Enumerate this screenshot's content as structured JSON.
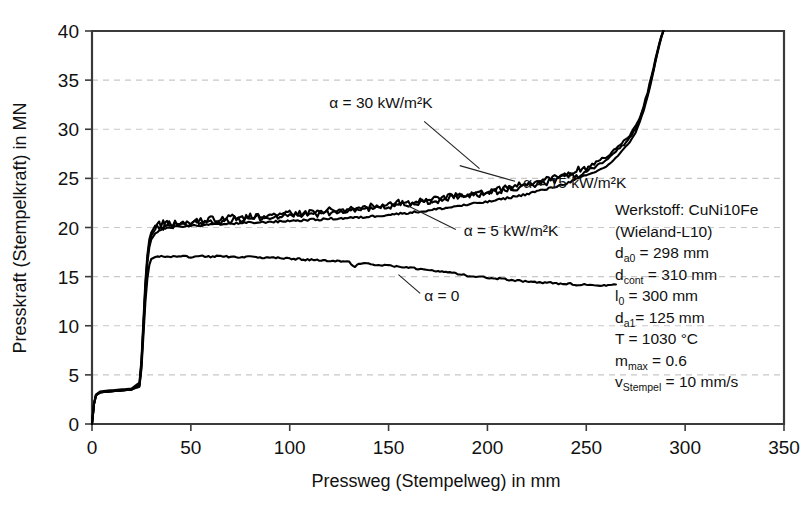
{
  "chart_data": {
    "type": "line",
    "title": "",
    "xlabel": "Pressweg (Stempelweg) in mm",
    "ylabel": "Presskraft (Stempelkraft) in MN",
    "xlim": [
      0,
      350
    ],
    "ylim": [
      0,
      40
    ],
    "xticks": [
      "0",
      "50",
      "100",
      "150",
      "200",
      "250",
      "300",
      "350"
    ],
    "yticks": [
      "0",
      "5",
      "10",
      "15",
      "20",
      "25",
      "30",
      "35",
      "40"
    ],
    "grid": true,
    "legend_position": "inline-annotations",
    "series": [
      {
        "name": "alpha = 30 kW/m²K",
        "label": "α = 30 kW/m²K",
        "x": [
          0,
          1,
          2,
          4,
          8,
          14,
          20,
          24,
          25,
          26,
          27,
          28,
          29,
          30,
          32,
          34,
          36,
          38,
          40,
          44,
          48,
          52,
          56,
          60,
          65,
          70,
          75,
          80,
          85,
          90,
          95,
          100,
          105,
          110,
          115,
          120,
          125,
          130,
          135,
          140,
          145,
          150,
          155,
          160,
          165,
          170,
          175,
          180,
          185,
          190,
          195,
          200,
          205,
          210,
          215,
          220,
          225,
          230,
          235,
          240,
          245,
          250,
          255,
          260,
          263,
          266,
          269,
          272,
          275,
          277,
          279,
          281,
          283,
          285,
          287,
          288,
          289
        ],
        "y": [
          0,
          2.1,
          3.0,
          3.3,
          3.4,
          3.5,
          3.6,
          4.2,
          6.5,
          10.5,
          14.5,
          17.2,
          18.8,
          19.5,
          20.2,
          19.9,
          20.4,
          20.2,
          20.5,
          20.3,
          20.6,
          20.4,
          20.8,
          20.5,
          20.9,
          20.7,
          21.1,
          20.8,
          21.2,
          21.0,
          21.4,
          21.1,
          21.5,
          21.3,
          21.7,
          21.4,
          21.9,
          21.6,
          22.1,
          21.9,
          22.3,
          22.1,
          22.6,
          22.3,
          22.8,
          22.6,
          23.1,
          22.9,
          23.4,
          23.1,
          23.7,
          23.4,
          24.0,
          23.8,
          24.4,
          24.2,
          24.8,
          24.6,
          25.3,
          25.1,
          25.9,
          26.0,
          26.6,
          27.2,
          27.6,
          28.2,
          28.8,
          29.4,
          30.3,
          31.2,
          32.4,
          33.8,
          35.4,
          37.2,
          38.8,
          39.5,
          40.0
        ]
      },
      {
        "name": "alpha = 15 kW/m²K",
        "label": "α = 15 kW/m²K",
        "x": [
          0,
          1,
          2,
          4,
          8,
          14,
          20,
          24,
          25,
          26,
          27,
          28,
          29,
          30,
          32,
          34,
          36,
          38,
          40,
          44,
          48,
          52,
          56,
          60,
          65,
          70,
          75,
          80,
          85,
          90,
          95,
          100,
          105,
          110,
          115,
          120,
          125,
          130,
          135,
          140,
          145,
          150,
          155,
          160,
          165,
          170,
          175,
          180,
          185,
          190,
          195,
          200,
          205,
          210,
          215,
          220,
          225,
          230,
          235,
          240,
          245,
          250,
          255,
          260,
          263,
          266,
          269,
          272,
          275,
          277,
          279,
          281,
          283,
          285,
          287,
          288,
          289
        ],
        "y": [
          0,
          2.0,
          2.9,
          3.2,
          3.3,
          3.4,
          3.5,
          4.0,
          6.2,
          10.0,
          14.0,
          16.8,
          18.4,
          19.2,
          19.8,
          20.3,
          19.9,
          20.5,
          20.1,
          20.6,
          20.2,
          20.8,
          20.4,
          20.9,
          20.6,
          21.1,
          20.8,
          21.2,
          21.0,
          21.4,
          21.1,
          21.5,
          21.2,
          21.6,
          21.3,
          21.8,
          21.5,
          22.0,
          21.7,
          22.2,
          21.9,
          22.4,
          22.2,
          22.6,
          22.4,
          22.9,
          22.7,
          23.2,
          23.0,
          23.5,
          23.2,
          23.8,
          23.6,
          24.1,
          23.9,
          24.5,
          24.3,
          24.9,
          24.7,
          25.4,
          25.2,
          25.8,
          26.2,
          26.9,
          27.3,
          27.9,
          28.5,
          29.2,
          30.0,
          31.0,
          32.2,
          33.6,
          35.2,
          37.0,
          38.7,
          39.4,
          40.0
        ]
      },
      {
        "name": "alpha = 5 kW/m²K",
        "label": "α = 5 kW/m²K",
        "x": [
          0,
          1,
          2,
          4,
          8,
          14,
          20,
          24,
          25,
          26,
          27,
          28,
          29,
          30,
          32,
          34,
          36,
          40,
          45,
          50,
          55,
          60,
          65,
          70,
          75,
          80,
          85,
          90,
          95,
          100,
          105,
          110,
          115,
          120,
          125,
          130,
          135,
          140,
          145,
          150,
          155,
          160,
          165,
          170,
          175,
          180,
          185,
          190,
          195,
          200,
          205,
          210,
          215,
          220,
          225,
          230,
          235,
          240,
          245,
          250,
          255,
          260,
          263,
          266,
          269,
          272,
          275,
          277,
          279,
          281,
          283,
          285,
          287,
          288,
          289
        ],
        "y": [
          0,
          2.0,
          2.9,
          3.2,
          3.3,
          3.4,
          3.5,
          3.9,
          6.0,
          9.8,
          13.6,
          16.4,
          18.0,
          18.8,
          19.4,
          19.7,
          19.9,
          20.0,
          20.1,
          20.2,
          20.2,
          20.3,
          20.3,
          20.4,
          20.4,
          20.5,
          20.5,
          20.6,
          20.6,
          20.7,
          20.7,
          20.8,
          20.8,
          20.9,
          20.9,
          21.0,
          21.0,
          21.1,
          21.2,
          21.3,
          21.4,
          21.5,
          21.6,
          21.7,
          21.9,
          22.0,
          22.2,
          22.3,
          22.5,
          22.6,
          22.8,
          23.0,
          23.2,
          23.4,
          23.7,
          23.9,
          24.2,
          24.5,
          24.9,
          25.3,
          25.7,
          26.2,
          26.7,
          27.3,
          28.0,
          28.7,
          29.7,
          30.7,
          31.9,
          33.3,
          35.0,
          36.9,
          38.6,
          39.4,
          40.0
        ]
      },
      {
        "name": "alpha = 0",
        "label": "α = 0",
        "x": [
          0,
          1,
          2,
          4,
          8,
          14,
          20,
          24,
          25,
          26,
          27,
          28,
          29,
          30,
          32,
          34,
          36,
          38,
          40,
          45,
          50,
          55,
          60,
          65,
          70,
          75,
          80,
          85,
          90,
          95,
          100,
          105,
          110,
          115,
          120,
          125,
          130,
          133,
          135,
          140,
          145,
          150,
          155,
          160,
          165,
          170,
          175,
          180,
          185,
          190,
          195,
          200,
          205,
          210,
          215,
          220,
          225,
          230,
          235,
          240,
          245,
          250,
          255,
          260,
          265
        ],
        "y": [
          0,
          2.0,
          2.9,
          3.2,
          3.3,
          3.4,
          3.5,
          3.8,
          5.6,
          9.0,
          12.4,
          14.8,
          16.2,
          16.8,
          17.0,
          17.1,
          17.0,
          17.1,
          17.0,
          17.1,
          17.0,
          17.1,
          17.0,
          17.1,
          17.0,
          17.0,
          17.0,
          16.9,
          16.9,
          16.9,
          16.8,
          16.8,
          16.7,
          16.7,
          16.6,
          16.6,
          16.5,
          15.9,
          16.4,
          16.3,
          16.2,
          16.1,
          16.0,
          15.9,
          15.8,
          15.7,
          15.6,
          15.4,
          15.3,
          15.1,
          15.0,
          14.9,
          14.8,
          14.7,
          14.6,
          14.5,
          14.4,
          14.4,
          14.3,
          14.3,
          14.2,
          14.2,
          14.1,
          14.1,
          14.2
        ]
      }
    ],
    "annotations": [
      {
        "text": "α = 30 kW/m²K",
        "x": 120,
        "y": 32.2
      },
      {
        "text": "α = 15 kW/m²K",
        "x": 218,
        "y": 24.0
      },
      {
        "text": "α = 5 kW/m²K",
        "x": 188,
        "y": 19.1
      },
      {
        "text": "α = 0",
        "x": 168,
        "y": 12.5
      }
    ],
    "info_box": {
      "lines": [
        {
          "main": "Werkstoff: CuNi10Fe",
          "sub": "",
          "rest": ""
        },
        {
          "main": "(Wieland-L10)",
          "sub": "",
          "rest": ""
        },
        {
          "main": "d",
          "sub": "a0",
          "rest": " = 298 mm"
        },
        {
          "main": "d",
          "sub": "cont",
          "rest": " = 310 mm"
        },
        {
          "main": "l",
          "sub": "0",
          "rest": " =  300 mm"
        },
        {
          "main": "d",
          "sub": "a1",
          "rest": "= 125 mm"
        },
        {
          "main": "T = 1030 °C",
          "sub": "",
          "rest": ""
        },
        {
          "main": "m",
          "sub": "max",
          "rest": " = 0.6"
        },
        {
          "main": "v",
          "sub": "Stempel",
          "rest": " = 10 mm/s"
        }
      ]
    },
    "colors": {
      "curve": "#000000",
      "axis": "#3a3a3a",
      "grid": "#c8c8c8",
      "text": "#111111",
      "background": "#ffffff"
    }
  }
}
